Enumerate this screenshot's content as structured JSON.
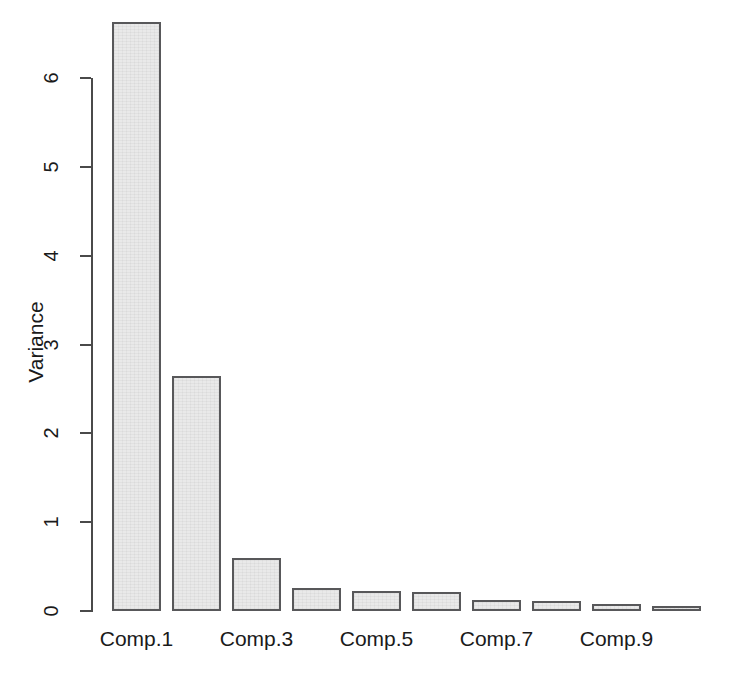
{
  "chart_data": {
    "type": "bar",
    "title": "",
    "subtitle": "",
    "xlabel": "",
    "ylabel": "Variance",
    "categories": [
      "Comp.1",
      "Comp.2",
      "Comp.3",
      "Comp.4",
      "Comp.5",
      "Comp.6",
      "Comp.7",
      "Comp.8",
      "Comp.9",
      "Comp.10"
    ],
    "values": [
      6.63,
      2.64,
      0.6,
      0.26,
      0.22,
      0.21,
      0.12,
      0.11,
      0.08,
      0.05
    ],
    "ylim": [
      0,
      6.7
    ],
    "y_ticks": [
      0,
      1,
      2,
      3,
      4,
      5,
      6
    ],
    "y_tick_labels": [
      "0",
      "1",
      "2",
      "3",
      "4",
      "5",
      "6"
    ],
    "x_tick_labels": [
      "Comp.1",
      "Comp.3",
      "Comp.5",
      "Comp.7",
      "Comp.9"
    ],
    "x_tick_label_indices": [
      0,
      2,
      4,
      6,
      8
    ],
    "grid": false,
    "legend": "none",
    "bar_fill_color": "#e9e9e9",
    "bar_border_color": "#58585a",
    "axis_color": "#4a4a4a",
    "text_color": "#1a1a1a",
    "background_color": "#ffffff"
  },
  "geometry": {
    "y_zero_px": 611,
    "px_per_unit": 88.83,
    "bar_left_first_px": 112,
    "bar_width_px": 49,
    "bar_pitch_px": 60
  }
}
